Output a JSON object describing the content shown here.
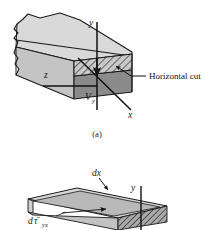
{
  "figure": {
    "background_color": "#ffffff",
    "panel_a": {
      "caption": "(a)",
      "annotation_label": "Horizontal cut",
      "axes": {
        "y_label": "y",
        "x_label": "x",
        "z_label": "z"
      },
      "force_label": "V",
      "force_subscript": "y",
      "colors": {
        "top_face": "#d6d6d6",
        "front_face": "#bdbdbd",
        "end_face_upper": "#c9c9c9",
        "end_face_lower": "#8f8f8f",
        "hatch_line": "#2b2b2b",
        "outline": "#1a1a1a"
      }
    },
    "panel_b": {
      "dx_label": "dx",
      "y_label": "y",
      "stress_label_d": "d",
      "stress_label_tau": "τ̄",
      "stress_label_sub": "yx",
      "colors": {
        "top_face": "#dcdcdc",
        "inner_face": "#b5b5b5",
        "front_face": "#c4c4c4",
        "end_hatch": "#9a9a9a",
        "outline": "#1a1a1a"
      }
    }
  }
}
